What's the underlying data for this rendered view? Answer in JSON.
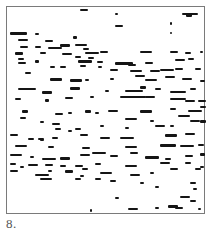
{
  "figure": {
    "label": "8.",
    "frame": {
      "left": 6,
      "top": 6,
      "width": 199,
      "height": 208,
      "border_color": "#7a7a7a"
    },
    "ink_color": "#151515",
    "strokes": [
      [
        80,
        9,
        8,
        1
      ],
      [
        115,
        13,
        3,
        1
      ],
      [
        182,
        13,
        16,
        1
      ],
      [
        186,
        14,
        6,
        2
      ],
      [
        115,
        25,
        8,
        1
      ],
      [
        170,
        22,
        2,
        2
      ],
      [
        170,
        32,
        2,
        1
      ],
      [
        10,
        32,
        17,
        2
      ],
      [
        35,
        33,
        4,
        1
      ],
      [
        73,
        36,
        4,
        2
      ],
      [
        18,
        39,
        10,
        1
      ],
      [
        45,
        40,
        8,
        1
      ],
      [
        60,
        44,
        10,
        2
      ],
      [
        75,
        44,
        12,
        1
      ],
      [
        20,
        46,
        8,
        1
      ],
      [
        35,
        46,
        6,
        1
      ],
      [
        48,
        47,
        14,
        1
      ],
      [
        83,
        48,
        6,
        1
      ],
      [
        140,
        51,
        12,
        1
      ],
      [
        170,
        51,
        8,
        1
      ],
      [
        185,
        52,
        6,
        1
      ],
      [
        200,
        51,
        3,
        1
      ],
      [
        15,
        52,
        8,
        2
      ],
      [
        40,
        52,
        6,
        1
      ],
      [
        62,
        53,
        10,
        1
      ],
      [
        85,
        52,
        14,
        1
      ],
      [
        100,
        51,
        8,
        1
      ],
      [
        75,
        56,
        6,
        1
      ],
      [
        88,
        57,
        6,
        1
      ],
      [
        18,
        58,
        6,
        1
      ],
      [
        35,
        60,
        4,
        2
      ],
      [
        78,
        60,
        14,
        2
      ],
      [
        97,
        61,
        6,
        1
      ],
      [
        115,
        62,
        18,
        2
      ],
      [
        128,
        64,
        8,
        1
      ],
      [
        145,
        62,
        8,
        1
      ],
      [
        175,
        59,
        10,
        1
      ],
      [
        188,
        58,
        6,
        1
      ],
      [
        18,
        62,
        8,
        1
      ],
      [
        50,
        66,
        5,
        1
      ],
      [
        60,
        66,
        6,
        1
      ],
      [
        80,
        65,
        6,
        1
      ],
      [
        98,
        66,
        4,
        1
      ],
      [
        110,
        69,
        8,
        1
      ],
      [
        130,
        70,
        12,
        1
      ],
      [
        150,
        70,
        10,
        1
      ],
      [
        160,
        69,
        14,
        1
      ],
      [
        175,
        68,
        8,
        1
      ],
      [
        195,
        68,
        6,
        1
      ],
      [
        25,
        72,
        6,
        1
      ],
      [
        50,
        78,
        12,
        2
      ],
      [
        70,
        79,
        12,
        2
      ],
      [
        85,
        79,
        4,
        1
      ],
      [
        110,
        78,
        4,
        1
      ],
      [
        135,
        75,
        10,
        1
      ],
      [
        145,
        79,
        12,
        1
      ],
      [
        165,
        76,
        10,
        1
      ],
      [
        182,
        78,
        10,
        1
      ],
      [
        200,
        80,
        5,
        1
      ],
      [
        18,
        88,
        18,
        1
      ],
      [
        42,
        91,
        10,
        2
      ],
      [
        70,
        87,
        10,
        2
      ],
      [
        105,
        90,
        4,
        1
      ],
      [
        125,
        90,
        18,
        1
      ],
      [
        140,
        86,
        6,
        2
      ],
      [
        155,
        88,
        6,
        1
      ],
      [
        170,
        91,
        16,
        1
      ],
      [
        190,
        88,
        6,
        1
      ],
      [
        15,
        98,
        6,
        1
      ],
      [
        45,
        99,
        4,
        2
      ],
      [
        65,
        97,
        8,
        1
      ],
      [
        90,
        96,
        4,
        1
      ],
      [
        120,
        96,
        26,
        1
      ],
      [
        145,
        96,
        10,
        1
      ],
      [
        170,
        98,
        16,
        1
      ],
      [
        185,
        100,
        10,
        1
      ],
      [
        198,
        100,
        8,
        1
      ],
      [
        22,
        110,
        6,
        2
      ],
      [
        55,
        113,
        8,
        1
      ],
      [
        68,
        112,
        4,
        1
      ],
      [
        85,
        110,
        6,
        2
      ],
      [
        95,
        112,
        4,
        1
      ],
      [
        108,
        110,
        10,
        1
      ],
      [
        140,
        110,
        12,
        2
      ],
      [
        170,
        108,
        6,
        1
      ],
      [
        188,
        110,
        14,
        1
      ],
      [
        200,
        106,
        6,
        1
      ],
      [
        20,
        117,
        6,
        1
      ],
      [
        40,
        121,
        4,
        1
      ],
      [
        52,
        123,
        8,
        1
      ],
      [
        125,
        118,
        12,
        1
      ],
      [
        150,
        120,
        4,
        1
      ],
      [
        178,
        115,
        12,
        1
      ],
      [
        190,
        120,
        10,
        1
      ],
      [
        200,
        120,
        6,
        2
      ],
      [
        55,
        128,
        6,
        1
      ],
      [
        75,
        128,
        6,
        1
      ],
      [
        100,
        125,
        4,
        1
      ],
      [
        125,
        127,
        4,
        1
      ],
      [
        155,
        125,
        10,
        1
      ],
      [
        170,
        125,
        4,
        1
      ],
      [
        10,
        134,
        8,
        1
      ],
      [
        28,
        138,
        6,
        1
      ],
      [
        38,
        138,
        6,
        1
      ],
      [
        52,
        137,
        6,
        1
      ],
      [
        68,
        130,
        4,
        1
      ],
      [
        80,
        134,
        8,
        1
      ],
      [
        100,
        137,
        10,
        1
      ],
      [
        120,
        137,
        14,
        1
      ],
      [
        165,
        134,
        12,
        2
      ],
      [
        185,
        133,
        10,
        1
      ],
      [
        15,
        145,
        12,
        1
      ],
      [
        48,
        146,
        6,
        1
      ],
      [
        82,
        147,
        8,
        1
      ],
      [
        125,
        146,
        12,
        1
      ],
      [
        160,
        144,
        16,
        2
      ],
      [
        180,
        145,
        14,
        1
      ],
      [
        198,
        144,
        6,
        1
      ],
      [
        40,
        139,
        4,
        1
      ],
      [
        10,
        154,
        12,
        1
      ],
      [
        30,
        156,
        4,
        1
      ],
      [
        42,
        158,
        14,
        1
      ],
      [
        60,
        157,
        10,
        2
      ],
      [
        80,
        154,
        10,
        1
      ],
      [
        92,
        152,
        14,
        1
      ],
      [
        110,
        155,
        8,
        1
      ],
      [
        130,
        152,
        8,
        1
      ],
      [
        145,
        156,
        14,
        2
      ],
      [
        165,
        158,
        6,
        1
      ],
      [
        185,
        155,
        8,
        1
      ],
      [
        200,
        153,
        5,
        2
      ],
      [
        10,
        163,
        6,
        1
      ],
      [
        20,
        166,
        4,
        1
      ],
      [
        28,
        164,
        10,
        1
      ],
      [
        45,
        164,
        8,
        1
      ],
      [
        60,
        165,
        6,
        1
      ],
      [
        75,
        165,
        8,
        1
      ],
      [
        95,
        163,
        6,
        1
      ],
      [
        125,
        165,
        12,
        1
      ],
      [
        160,
        162,
        10,
        1
      ],
      [
        185,
        162,
        6,
        1
      ],
      [
        200,
        166,
        4,
        1
      ],
      [
        10,
        170,
        8,
        1
      ],
      [
        35,
        174,
        14,
        1
      ],
      [
        48,
        170,
        4,
        1
      ],
      [
        65,
        170,
        8,
        2
      ],
      [
        82,
        168,
        6,
        1
      ],
      [
        100,
        172,
        12,
        1
      ],
      [
        130,
        174,
        10,
        1
      ],
      [
        150,
        172,
        4,
        1
      ],
      [
        170,
        168,
        8,
        1
      ],
      [
        195,
        168,
        6,
        1
      ],
      [
        80,
        175,
        4,
        1
      ],
      [
        40,
        178,
        12,
        1
      ],
      [
        75,
        178,
        6,
        1
      ],
      [
        95,
        178,
        6,
        1
      ],
      [
        110,
        180,
        6,
        1
      ],
      [
        140,
        182,
        4,
        1
      ],
      [
        190,
        182,
        6,
        1
      ],
      [
        155,
        186,
        4,
        1
      ],
      [
        193,
        188,
        4,
        1
      ],
      [
        115,
        197,
        4,
        1
      ],
      [
        180,
        196,
        10,
        1
      ],
      [
        190,
        200,
        6,
        1
      ],
      [
        90,
        209,
        2,
        2
      ],
      [
        128,
        208,
        10,
        1
      ],
      [
        155,
        207,
        4,
        1
      ],
      [
        168,
        205,
        10,
        2
      ],
      [
        175,
        207,
        8,
        1
      ],
      [
        198,
        208,
        3,
        1
      ]
    ]
  }
}
